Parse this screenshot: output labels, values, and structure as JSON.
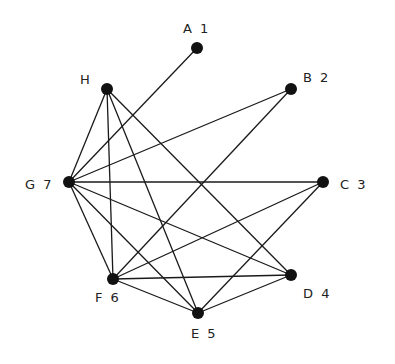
{
  "graph": {
    "type": "undirected",
    "node_radius": 6,
    "colors": {
      "node": "#111111",
      "edge": "#1a1a1a",
      "label": "#222222",
      "background": "#ffffff"
    },
    "nodes": [
      {
        "id": "A",
        "label": "A 1",
        "x": 197,
        "y": 48,
        "lx": 183,
        "ly": 33
      },
      {
        "id": "B",
        "label": "B 2",
        "x": 291,
        "y": 89,
        "lx": 303,
        "ly": 82
      },
      {
        "id": "C",
        "label": "C 3",
        "x": 323,
        "y": 182,
        "lx": 340,
        "ly": 189
      },
      {
        "id": "D",
        "label": "D 4",
        "x": 291,
        "y": 275,
        "lx": 303,
        "ly": 298
      },
      {
        "id": "E",
        "label": "E 5",
        "x": 198,
        "y": 313,
        "lx": 191,
        "ly": 338
      },
      {
        "id": "F",
        "label": "F 6",
        "x": 113,
        "y": 279,
        "lx": 95,
        "ly": 302
      },
      {
        "id": "G",
        "label": "G 7",
        "x": 69,
        "y": 182,
        "lx": 25,
        "ly": 189
      },
      {
        "id": "H",
        "label": "H",
        "x": 107,
        "y": 89,
        "lx": 80,
        "ly": 84
      }
    ],
    "edges": [
      [
        "G",
        "A"
      ],
      [
        "G",
        "B"
      ],
      [
        "G",
        "C"
      ],
      [
        "G",
        "D"
      ],
      [
        "G",
        "E"
      ],
      [
        "G",
        "F"
      ],
      [
        "G",
        "H"
      ],
      [
        "H",
        "F"
      ],
      [
        "H",
        "E"
      ],
      [
        "H",
        "D"
      ],
      [
        "F",
        "B"
      ],
      [
        "F",
        "C"
      ],
      [
        "F",
        "D"
      ],
      [
        "F",
        "E"
      ],
      [
        "E",
        "C"
      ],
      [
        "E",
        "D"
      ]
    ]
  }
}
